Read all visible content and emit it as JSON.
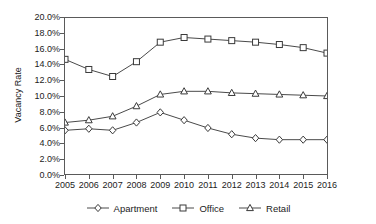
{
  "chart_data": {
    "type": "line",
    "title": "",
    "xlabel": "",
    "ylabel": "Vacancy Rate",
    "ylim": [
      0,
      20
    ],
    "ytick_labels": [
      "20.0%",
      "18.0%",
      "16.0%",
      "14.0%",
      "12.0%",
      "10.0%",
      "8.0%",
      "6.0%",
      "4.0%",
      "2.0%",
      "0.0%"
    ],
    "ytick_values": [
      20,
      18,
      16,
      14,
      12,
      10,
      8,
      6,
      4,
      2,
      0
    ],
    "categories": [
      "2005",
      "2006",
      "2007",
      "2008",
      "2009",
      "2010",
      "2011",
      "2012",
      "2013",
      "2014",
      "2015",
      "2016"
    ],
    "grid": false,
    "legend_position": "bottom",
    "series": [
      {
        "name": "Apartment",
        "marker": "diamond",
        "values": [
          5.6,
          5.8,
          5.6,
          6.6,
          7.9,
          6.9,
          5.9,
          5.1,
          4.6,
          4.4,
          4.4,
          4.4
        ]
      },
      {
        "name": "Office",
        "marker": "square",
        "values": [
          14.7,
          13.4,
          12.5,
          14.4,
          16.9,
          17.5,
          17.3,
          17.1,
          16.9,
          16.6,
          16.2,
          15.5
        ]
      },
      {
        "name": "Retail",
        "marker": "triangle",
        "values": [
          6.6,
          6.9,
          7.4,
          8.7,
          10.2,
          10.6,
          10.6,
          10.4,
          10.3,
          10.2,
          10.1,
          10.0
        ]
      }
    ]
  },
  "colors": {
    "line": "#4a4a4a",
    "axis": "#5a5a5a",
    "text": "#1c1c1c",
    "background": "#ffffff"
  }
}
